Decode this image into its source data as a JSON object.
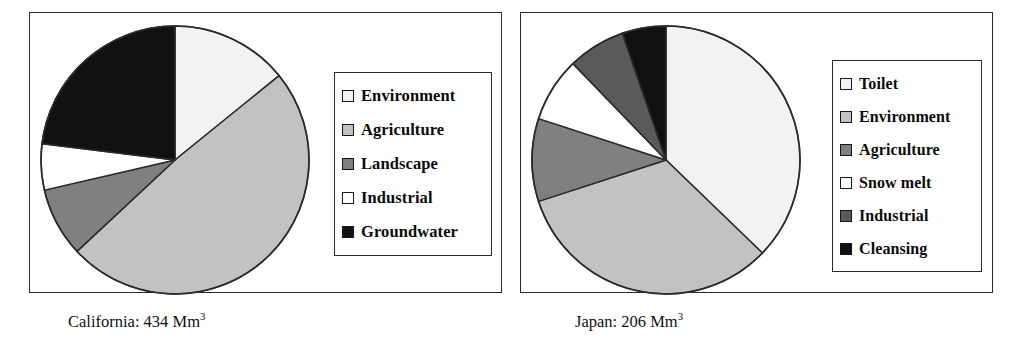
{
  "figure": {
    "panels": [
      {
        "id": "california",
        "caption_text": "California: 434 Mm",
        "caption_sup": "3",
        "legend_title": "",
        "legend": [
          {
            "label": "Environment",
            "color": "#f2f2f2"
          },
          {
            "label": "Agriculture",
            "color": "#c2c2c2"
          },
          {
            "label": "Landscape",
            "color": "#808080"
          },
          {
            "label": "Industrial",
            "color": "#ffffff"
          },
          {
            "label": "Groundwater",
            "color": "#111111"
          }
        ]
      },
      {
        "id": "japan",
        "caption_text": "Japan: 206 Mm",
        "caption_sup": "3",
        "legend_title": "",
        "legend": [
          {
            "label": "Toilet",
            "color": "#f2f2f2"
          },
          {
            "label": "Environment",
            "color": "#c2c2c2"
          },
          {
            "label": "Agriculture",
            "color": "#808080"
          },
          {
            "label": "Snow melt",
            "color": "#ffffff"
          },
          {
            "label": "Industrial",
            "color": "#5a5a5a"
          },
          {
            "label": "Cleansing",
            "color": "#111111"
          }
        ]
      }
    ]
  },
  "chart_data": [
    {
      "type": "pie",
      "title": "California: 434 Mm3",
      "units": "Mm3",
      "total": 434,
      "start_angle_deg": 0,
      "direction": "clockwise",
      "categories": [
        "Environment",
        "Agriculture",
        "Landscape",
        "Industrial",
        "Groundwater"
      ],
      "values": [
        14.2,
        48.9,
        8.3,
        5.6,
        23.0
      ],
      "value_unit": "percent",
      "angles_deg": [
        51,
        176,
        30,
        20,
        83
      ],
      "colors": [
        "#f2f2f2",
        "#c2c2c2",
        "#808080",
        "#ffffff",
        "#111111"
      ],
      "legend_position": "right",
      "grid": false
    },
    {
      "type": "pie",
      "title": "Japan: 206 Mm3",
      "units": "Mm3",
      "total": 206,
      "start_angle_deg": 0,
      "direction": "clockwise",
      "categories": [
        "Toilet",
        "Environment",
        "Agriculture",
        "Snow melt",
        "Industrial",
        "Cleansing"
      ],
      "values": [
        37.2,
        32.8,
        10.0,
        7.8,
        6.9,
        5.3
      ],
      "value_unit": "percent",
      "angles_deg": [
        134,
        118,
        36,
        28,
        25,
        19
      ],
      "colors": [
        "#f2f2f2",
        "#c2c2c2",
        "#808080",
        "#ffffff",
        "#5a5a5a",
        "#111111"
      ],
      "legend_position": "right",
      "grid": false
    }
  ]
}
